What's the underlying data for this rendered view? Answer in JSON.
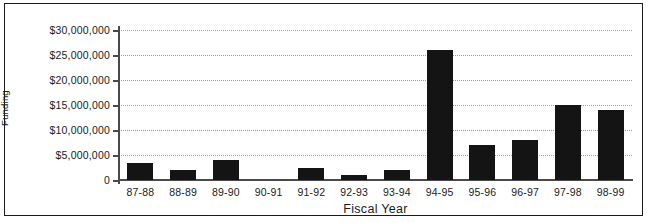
{
  "chart_data": {
    "type": "bar",
    "title": "",
    "xlabel": "Fiscal Year",
    "ylabel": "Capital Improvements Funding",
    "ylabel_line1": "Capital Improvements",
    "ylabel_line2": "Funding",
    "categories": [
      "87-88",
      "88-89",
      "89-90",
      "90-91",
      "91-92",
      "92-93",
      "93-94",
      "94-95",
      "95-96",
      "96-97",
      "97-98",
      "98-99"
    ],
    "values": [
      3500000,
      2000000,
      4000000,
      0,
      2500000,
      1000000,
      2000000,
      26000000,
      7000000,
      8000000,
      15000000,
      14000000
    ],
    "ylim": [
      0,
      30000000
    ],
    "ytick_values": [
      30000000,
      25000000,
      20000000,
      15000000,
      10000000,
      5000000,
      0
    ],
    "ytick_labels": [
      "$30,000,000",
      "$25,000,000",
      "$20,000,000",
      "$15,000,000",
      "$10,000,000",
      "$5,000,000",
      "0"
    ],
    "grid": true,
    "grid_style": "dotted-horizontal",
    "legend": "none",
    "bar_color": "#141414",
    "grid_color": "#9a9a9a",
    "axis_color": "#4a4a4a",
    "border_color": "#1b1b1b",
    "background_color": "#ffffff"
  }
}
